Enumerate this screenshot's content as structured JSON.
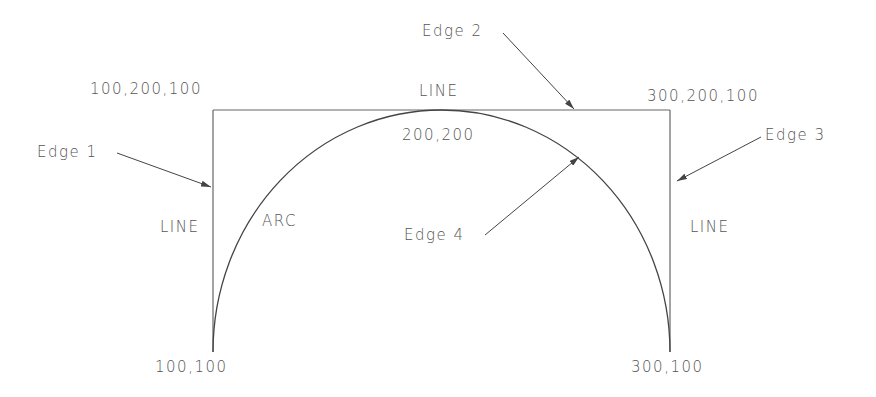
{
  "diagram": {
    "type": "cad-wireframe-sketch",
    "colors": {
      "line": "#555555",
      "arc": "#444444",
      "text": "#555555",
      "background": "#ffffff"
    },
    "labels": {
      "edge1": "Edge 1",
      "edge2": "Edge 2",
      "edge3": "Edge 3",
      "edge4": "Edge 4",
      "top_line": "LINE",
      "left_line": "LINE",
      "right_line": "LINE",
      "arc": "ARC",
      "top_left_coord": "100,200,100",
      "top_right_coord": "300,200,100",
      "arc_apex_coord": "200,200",
      "bottom_left_coord": "100,100",
      "bottom_right_coord": "300,100"
    },
    "entities": [
      {
        "id": "edge1",
        "kind": "LINE",
        "from": "100,100",
        "to": "100,200,100"
      },
      {
        "id": "edge2",
        "kind": "LINE",
        "from": "100,200,100",
        "to": "300,200,100"
      },
      {
        "id": "edge3",
        "kind": "LINE",
        "from": "300,200,100",
        "to": "300,100"
      },
      {
        "id": "edge4",
        "kind": "ARC",
        "from": "100,100",
        "through": "200,200",
        "to": "300,100"
      }
    ]
  }
}
